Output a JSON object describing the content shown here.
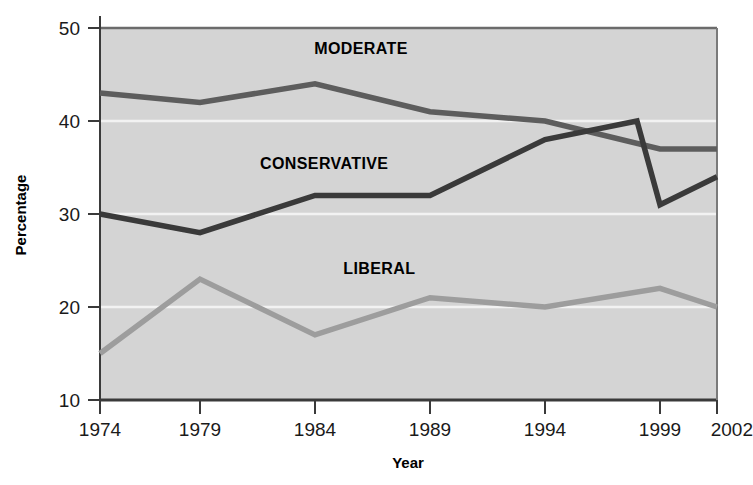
{
  "chart_data": {
    "type": "line",
    "title": "",
    "xlabel": "Year",
    "ylabel": "Percentage",
    "categories": [
      1974,
      1979,
      1984,
      1989,
      1994,
      1999,
      2002
    ],
    "x_tick_labels": [
      "1974",
      "1979",
      "1984",
      "1989",
      "1994",
      "1999",
      "2002"
    ],
    "y_tick_labels": [
      "10",
      "20",
      "30",
      "40",
      "50"
    ],
    "y_ticks": [
      10,
      20,
      30,
      40,
      50
    ],
    "xlim": [
      1974,
      2002
    ],
    "ylim": [
      10,
      50
    ],
    "grid": true,
    "grid_orientation": "horizontal",
    "legend_position": "inline-annotations",
    "plot_background": "#d4d4d4",
    "grid_color": "#f2f2f2",
    "series": [
      {
        "name": "MODERATE",
        "color": "#5d5d5d",
        "x": [
          1974,
          1979,
          1984,
          1989,
          1994,
          1999,
          2002
        ],
        "values": [
          43,
          42,
          44,
          41,
          40,
          37,
          37
        ],
        "label_x": 1986.0,
        "label_y": 47.2
      },
      {
        "name": "CONSERVATIVE",
        "color": "#3a3a3a",
        "x": [
          1974,
          1979,
          1984,
          1989,
          1994,
          1998,
          1999,
          2002
        ],
        "values": [
          30,
          28,
          32,
          32,
          38,
          40,
          31,
          34
        ],
        "label_x": 1984.4,
        "label_y": 34.8
      },
      {
        "name": "LIBERAL",
        "color": "#9d9d9d",
        "x": [
          1974,
          1979,
          1984,
          1989,
          1994,
          1999,
          2002
        ],
        "values": [
          15,
          23,
          17,
          21,
          20,
          22,
          20
        ],
        "label_x": 1986.8,
        "label_y": 23.6
      }
    ]
  }
}
